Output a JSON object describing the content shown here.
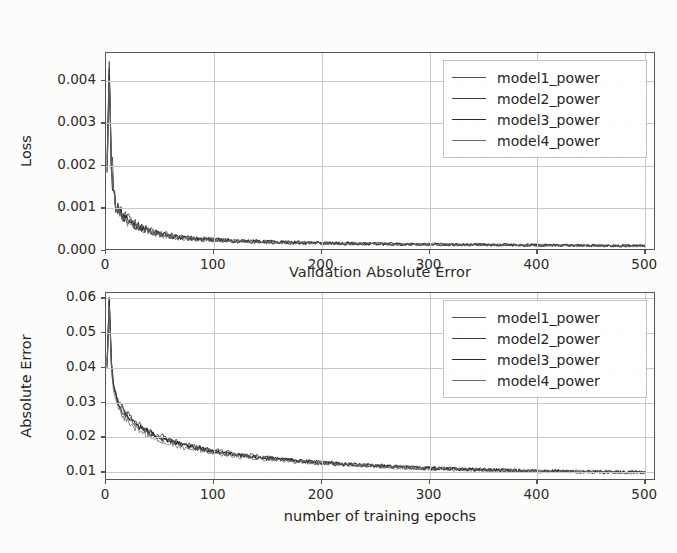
{
  "figure": {
    "background_color": "#fcfcfa",
    "axes_face_color": "#ffffff",
    "grid_color": "#c9c9c9",
    "spine_color": "#555555"
  },
  "chart_data": [
    {
      "type": "line",
      "id": "validation-loss",
      "title": "Validation Loss",
      "xlabel": "",
      "ylabel": "Loss",
      "xlim": [
        0,
        510
      ],
      "ylim": [
        0.0,
        0.00465
      ],
      "grid": true,
      "legend_position": "upper right",
      "xticks": [
        0,
        100,
        200,
        300,
        400,
        500
      ],
      "xtick_labels": [
        "0",
        "100",
        "200",
        "300",
        "400",
        "500"
      ],
      "yticks": [
        0.0,
        0.001,
        0.002,
        0.003,
        0.004
      ],
      "ytick_labels": [
        "0.000",
        "0.001",
        "0.002",
        "0.003",
        "0.004"
      ],
      "series": [
        {
          "name": "model1_power",
          "color": "#4d4d4d",
          "linewidth": 1.0,
          "x": [
            1,
            3,
            5,
            7,
            9,
            12,
            15,
            18,
            22,
            26,
            30,
            35,
            40,
            45,
            50,
            60,
            70,
            80,
            90,
            100,
            120,
            140,
            160,
            180,
            200,
            220,
            240,
            260,
            280,
            300,
            330,
            360,
            390,
            420,
            450,
            480,
            500
          ],
          "y": [
            0.002,
            0.0044,
            0.0023,
            0.0015,
            0.00115,
            0.00096,
            0.00088,
            0.00082,
            0.00072,
            0.00065,
            0.0006,
            0.00054,
            0.00049,
            0.00044,
            0.00042,
            0.00037,
            0.00033,
            0.00031,
            0.00029,
            0.00027,
            0.00024,
            0.00023,
            0.00021,
            0.0002,
            0.00019,
            0.00018,
            0.00018,
            0.00017,
            0.00016,
            0.00016,
            0.00015,
            0.00015,
            0.00014,
            0.00014,
            0.00013,
            0.00013,
            0.00013
          ]
        },
        {
          "name": "model2_power",
          "color": "#3d3d3d",
          "linewidth": 1.0,
          "x": [
            1,
            3,
            5,
            7,
            9,
            12,
            15,
            18,
            22,
            26,
            30,
            35,
            40,
            45,
            50,
            60,
            70,
            80,
            90,
            100,
            120,
            140,
            160,
            180,
            200,
            220,
            240,
            260,
            280,
            300,
            330,
            360,
            390,
            420,
            450,
            480,
            500
          ],
          "y": [
            0.00215,
            0.00425,
            0.00215,
            0.0014,
            0.0011,
            0.00092,
            0.00084,
            0.00078,
            0.0007,
            0.00063,
            0.00058,
            0.00052,
            0.00047,
            0.00043,
            0.0004,
            0.00036,
            0.00032,
            0.0003,
            0.00028,
            0.00026,
            0.00024,
            0.00022,
            0.00021,
            0.0002,
            0.00019,
            0.00018,
            0.00017,
            0.00017,
            0.00016,
            0.00016,
            0.00015,
            0.00014,
            0.00014,
            0.00013,
            0.00013,
            0.00012,
            0.00012
          ]
        },
        {
          "name": "model3_power",
          "color": "#2b2b2b",
          "linewidth": 1.1,
          "x": [
            1,
            3,
            5,
            7,
            9,
            12,
            15,
            18,
            22,
            26,
            30,
            35,
            40,
            45,
            50,
            60,
            70,
            80,
            90,
            100,
            120,
            140,
            160,
            180,
            200,
            220,
            240,
            260,
            280,
            300,
            330,
            360,
            390,
            420,
            450,
            480,
            500
          ],
          "y": [
            0.0019,
            0.0041,
            0.00205,
            0.00135,
            0.00108,
            0.0009,
            0.00082,
            0.00076,
            0.00068,
            0.00062,
            0.00057,
            0.00051,
            0.00046,
            0.00042,
            0.00039,
            0.00035,
            0.00031,
            0.00029,
            0.00027,
            0.00026,
            0.00023,
            0.00022,
            0.0002,
            0.00019,
            0.00018,
            0.00018,
            0.00017,
            0.00016,
            0.00016,
            0.00015,
            0.00015,
            0.00014,
            0.00014,
            0.00013,
            0.00013,
            0.00012,
            0.00012
          ]
        },
        {
          "name": "model4_power",
          "color": "#6e6e6e",
          "linewidth": 0.9,
          "x": [
            1,
            3,
            5,
            7,
            9,
            12,
            15,
            18,
            22,
            26,
            30,
            35,
            40,
            45,
            50,
            60,
            70,
            80,
            90,
            100,
            120,
            140,
            160,
            180,
            200,
            220,
            240,
            260,
            280,
            300,
            330,
            360,
            390,
            420,
            450,
            480,
            500
          ],
          "y": [
            0.00185,
            0.004,
            0.00198,
            0.0013,
            0.00104,
            0.00088,
            0.0008,
            0.00074,
            0.00066,
            0.0006,
            0.00055,
            0.0005,
            0.00045,
            0.00041,
            0.00038,
            0.00034,
            0.0003,
            0.00028,
            0.00027,
            0.00025,
            0.00023,
            0.00021,
            0.0002,
            0.00019,
            0.00018,
            0.00017,
            0.00017,
            0.00016,
            0.00015,
            0.00015,
            0.00014,
            0.00014,
            0.00013,
            0.00013,
            0.00012,
            0.00012,
            0.00011
          ]
        }
      ]
    },
    {
      "type": "line",
      "id": "validation-absolute-error",
      "title": "Validation Absolute Error",
      "xlabel": "number of training epochs",
      "ylabel": "Absolute Error",
      "xlim": [
        0,
        510
      ],
      "ylim": [
        0.0075,
        0.0615
      ],
      "grid": true,
      "legend_position": "upper right",
      "xticks": [
        0,
        100,
        200,
        300,
        400,
        500
      ],
      "xtick_labels": [
        "0",
        "100",
        "200",
        "300",
        "400",
        "500"
      ],
      "yticks": [
        0.01,
        0.02,
        0.03,
        0.04,
        0.05,
        0.06
      ],
      "ytick_labels": [
        "0.01",
        "0.02",
        "0.03",
        "0.04",
        "0.05",
        "0.06"
      ],
      "series": [
        {
          "name": "model1_power",
          "color": "#4d4d4d",
          "linewidth": 1.0,
          "x": [
            1,
            3,
            5,
            7,
            9,
            12,
            15,
            18,
            22,
            26,
            30,
            35,
            40,
            45,
            50,
            60,
            70,
            80,
            90,
            100,
            120,
            140,
            160,
            180,
            200,
            220,
            240,
            260,
            280,
            300,
            330,
            360,
            390,
            420,
            450,
            480,
            500
          ],
          "y": [
            0.041,
            0.0605,
            0.043,
            0.036,
            0.0322,
            0.03,
            0.0288,
            0.0275,
            0.026,
            0.0248,
            0.0238,
            0.0228,
            0.0219,
            0.0212,
            0.0205,
            0.0193,
            0.0183,
            0.0176,
            0.0169,
            0.0163,
            0.0153,
            0.0146,
            0.0139,
            0.0133,
            0.0129,
            0.0125,
            0.0121,
            0.0118,
            0.0115,
            0.0113,
            0.011,
            0.0107,
            0.0105,
            0.0104,
            0.0102,
            0.0101,
            0.01
          ]
        },
        {
          "name": "model2_power",
          "color": "#3d3d3d",
          "linewidth": 1.0,
          "x": [
            1,
            3,
            5,
            7,
            9,
            12,
            15,
            18,
            22,
            26,
            30,
            35,
            40,
            45,
            50,
            60,
            70,
            80,
            90,
            100,
            120,
            140,
            160,
            180,
            200,
            220,
            240,
            260,
            280,
            300,
            330,
            360,
            390,
            420,
            450,
            480,
            500
          ],
          "y": [
            0.042,
            0.06,
            0.042,
            0.0352,
            0.0318,
            0.0296,
            0.0283,
            0.027,
            0.0256,
            0.0244,
            0.0234,
            0.0225,
            0.0216,
            0.0209,
            0.0202,
            0.019,
            0.0181,
            0.0174,
            0.0167,
            0.0161,
            0.0151,
            0.0144,
            0.0138,
            0.0132,
            0.0128,
            0.0124,
            0.012,
            0.0117,
            0.0114,
            0.0112,
            0.0109,
            0.0107,
            0.0105,
            0.0103,
            0.0101,
            0.01,
            0.0099
          ]
        },
        {
          "name": "model3_power",
          "color": "#2b2b2b",
          "linewidth": 1.1,
          "x": [
            1,
            3,
            5,
            7,
            9,
            12,
            15,
            18,
            22,
            26,
            30,
            35,
            40,
            45,
            50,
            60,
            70,
            80,
            90,
            100,
            120,
            140,
            160,
            180,
            200,
            220,
            240,
            260,
            280,
            300,
            330,
            360,
            390,
            420,
            450,
            480,
            500
          ],
          "y": [
            0.0405,
            0.0592,
            0.0412,
            0.0348,
            0.0314,
            0.0292,
            0.0279,
            0.0267,
            0.0253,
            0.0241,
            0.0231,
            0.0222,
            0.0214,
            0.0207,
            0.02,
            0.0188,
            0.0179,
            0.0172,
            0.0166,
            0.016,
            0.015,
            0.0143,
            0.0137,
            0.0132,
            0.0127,
            0.0123,
            0.012,
            0.0117,
            0.0114,
            0.0111,
            0.0109,
            0.0106,
            0.0104,
            0.0103,
            0.0101,
            0.01,
            0.0099
          ]
        },
        {
          "name": "model4_power",
          "color": "#6e6e6e",
          "linewidth": 0.9,
          "x": [
            1,
            3,
            5,
            7,
            9,
            12,
            15,
            18,
            22,
            26,
            30,
            35,
            40,
            45,
            50,
            60,
            70,
            80,
            90,
            100,
            120,
            140,
            160,
            180,
            200,
            220,
            240,
            260,
            280,
            300,
            330,
            360,
            390,
            420,
            450,
            480,
            500
          ],
          "y": [
            0.0398,
            0.058,
            0.0395,
            0.033,
            0.03,
            0.028,
            0.0266,
            0.0254,
            0.024,
            0.0229,
            0.022,
            0.0211,
            0.0203,
            0.0197,
            0.0191,
            0.0181,
            0.0173,
            0.0166,
            0.016,
            0.0155,
            0.0146,
            0.014,
            0.0134,
            0.0129,
            0.0125,
            0.0121,
            0.0118,
            0.0115,
            0.0112,
            0.011,
            0.0107,
            0.0105,
            0.0103,
            0.0102,
            0.01,
            0.0099,
            0.0098
          ]
        }
      ]
    }
  ]
}
